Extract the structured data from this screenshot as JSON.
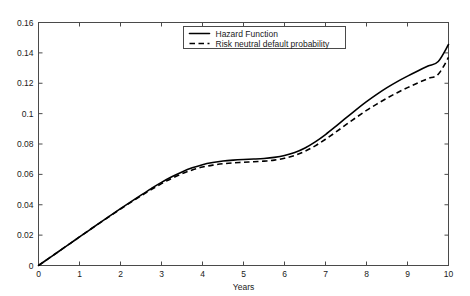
{
  "chart_data": {
    "type": "line",
    "title": "",
    "xlabel": "Years",
    "ylabel": "",
    "xlim": [
      0,
      10
    ],
    "ylim": [
      0,
      0.16
    ],
    "grid": false,
    "legend_position": "top-right-inside",
    "xticks": [
      "0",
      "1",
      "2",
      "3",
      "4",
      "5",
      "6",
      "7",
      "8",
      "9",
      "10"
    ],
    "xtick_values": [
      0,
      1,
      2,
      3,
      4,
      5,
      6,
      7,
      8,
      9,
      10
    ],
    "yticks": [
      "0",
      "0.02",
      "0.04",
      "0.06",
      "0.08",
      "0.1",
      "0.12",
      "0.14",
      "0.16"
    ],
    "ytick_values": [
      0,
      0.02,
      0.04,
      0.06,
      0.08,
      0.1,
      0.12,
      0.14,
      0.16
    ],
    "x": [
      0,
      0.25,
      0.5,
      0.75,
      1,
      1.25,
      1.5,
      1.75,
      2,
      2.25,
      2.5,
      2.75,
      3,
      3.25,
      3.5,
      3.75,
      4,
      4.25,
      4.5,
      4.75,
      5,
      5.25,
      5.5,
      5.75,
      6,
      6.25,
      6.5,
      6.75,
      7,
      7.25,
      7.5,
      7.75,
      8,
      8.25,
      8.5,
      8.75,
      9,
      9.25,
      9.5,
      9.75,
      10
    ],
    "series": [
      {
        "name": "Hazard Function",
        "style": "solid",
        "color": "#000000",
        "values": [
          0,
          0.0047,
          0.0094,
          0.0141,
          0.0188,
          0.0235,
          0.0282,
          0.0328,
          0.0374,
          0.0419,
          0.0463,
          0.0506,
          0.0547,
          0.0584,
          0.0616,
          0.0643,
          0.0664,
          0.0678,
          0.0688,
          0.0694,
          0.0698,
          0.0701,
          0.0705,
          0.0712,
          0.0724,
          0.0744,
          0.0774,
          0.0814,
          0.0862,
          0.0916,
          0.0972,
          0.1027,
          0.1079,
          0.1127,
          0.1171,
          0.1211,
          0.1247,
          0.1281,
          0.1313,
          0.1343,
          0.1455
        ]
      },
      {
        "name": "Risk neutral default probability",
        "style": "dashed",
        "color": "#000000",
        "values": [
          0,
          0.0047,
          0.0094,
          0.0141,
          0.0188,
          0.0235,
          0.0281,
          0.0327,
          0.0372,
          0.0416,
          0.0459,
          0.05,
          0.0539,
          0.0574,
          0.0604,
          0.0629,
          0.0648,
          0.0661,
          0.067,
          0.0676,
          0.068,
          0.0683,
          0.0687,
          0.0694,
          0.0706,
          0.0725,
          0.0752,
          0.0788,
          0.0831,
          0.0878,
          0.0927,
          0.0975,
          0.1021,
          0.1063,
          0.1102,
          0.1138,
          0.1171,
          0.1202,
          0.1231,
          0.1259,
          0.137
        ]
      }
    ]
  },
  "legend": {
    "entries": [
      {
        "label": "Hazard Function",
        "style": "solid"
      },
      {
        "label": "Risk neutral default probability",
        "style": "dashed"
      }
    ]
  }
}
